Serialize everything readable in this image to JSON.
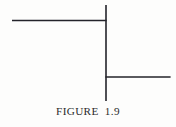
{
  "figure": {
    "caption": "FIGURE  1.9",
    "caption_label": "FIGURE",
    "caption_number": "1.9",
    "background_color": "#fdfdfc",
    "line_color": "#23232a",
    "caption_color": "#2b2b2b"
  },
  "chart_data": {
    "type": "line",
    "title": "FIGURE  1.9",
    "xlabel": "",
    "ylabel": "",
    "xlim": [
      0,
      176
    ],
    "ylim": [
      0,
      127
    ],
    "grid": false,
    "legend": "none",
    "segments": [
      {
        "name": "vertical-stem",
        "orientation": "vertical",
        "x1": 106,
        "y1": 5,
        "x2": 106,
        "y2": 101,
        "thickness": 1.6,
        "color": "#23232a"
      },
      {
        "name": "upper-left-branch",
        "orientation": "horizontal",
        "x1": 12,
        "y1": 20.5,
        "x2": 106,
        "y2": 20.5,
        "thickness": 1.6,
        "color": "#23232a"
      },
      {
        "name": "lower-right-branch",
        "orientation": "horizontal",
        "x1": 106,
        "y1": 77,
        "x2": 170,
        "y2": 77,
        "thickness": 1.6,
        "color": "#23232a"
      }
    ],
    "junctions": [
      {
        "name": "upper-tee-junction",
        "x": 106,
        "y": 20.5
      },
      {
        "name": "lower-tee-junction",
        "x": 106,
        "y": 77
      }
    ]
  }
}
